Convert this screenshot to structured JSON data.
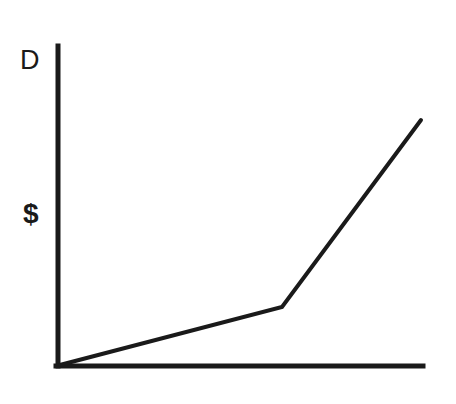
{
  "figure": {
    "background_color": "#ffffff",
    "ink_color": "#1a1a1a",
    "width": 456,
    "height": 404
  },
  "labels": {
    "y_axis_top": "D",
    "y_axis_middle": "$"
  },
  "chart_data": {
    "type": "line",
    "title": "",
    "xlabel": "",
    "ylabel": "$",
    "y_axis_top_label": "D",
    "grid": false,
    "legend": null,
    "axes": {
      "origin_px": [
        56,
        366
      ],
      "y_axis_top_px": [
        56,
        46
      ],
      "x_axis_right_px": [
        423,
        366
      ],
      "line_width_px": 4,
      "ticks_x": [],
      "ticks_y": [],
      "axis_color": "#1a1a1a"
    },
    "series": [
      {
        "name": "D",
        "color": "#1a1a1a",
        "line_width_px": 4,
        "points_px": [
          [
            56,
            366
          ],
          [
            282,
            307
          ],
          [
            421,
            120
          ]
        ],
        "description": "piecewise linear, shallow slope then steep slope after kink",
        "x": [
          0,
          0.616,
          1.0
        ],
        "y": [
          0,
          0.184,
          0.769
        ],
        "xlim": [
          0,
          1
        ],
        "ylim": [
          0,
          1
        ]
      }
    ]
  }
}
